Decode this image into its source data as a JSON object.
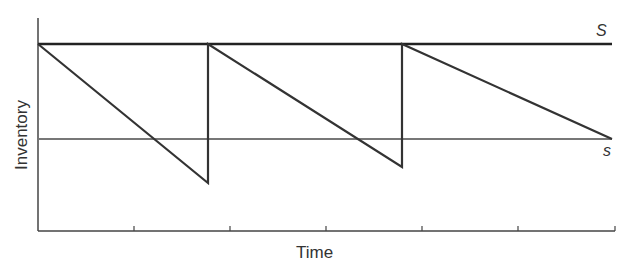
{
  "chart_data": {
    "type": "line",
    "title": "",
    "xlabel": "Time",
    "ylabel": "Inventory",
    "grid": false,
    "upper_level": {
      "label": "S",
      "y": 44
    },
    "reorder_level": {
      "label": "s",
      "y": 139
    },
    "series": [
      {
        "name": "Inventory level",
        "points": [
          [
            38,
            44
          ],
          [
            208,
            183
          ],
          [
            208,
            44
          ],
          [
            402,
            167
          ],
          [
            402,
            44
          ],
          [
            612,
            139
          ]
        ]
      }
    ],
    "x_ticks": [
      134,
      230,
      326,
      422,
      518,
      615
    ],
    "axis": {
      "x0": 38,
      "y_bottom": 231,
      "y_top": 18,
      "x_end": 615
    }
  },
  "labels": {
    "xlabel": "Time",
    "ylabel": "Inventory",
    "S": "S",
    "s": "s"
  }
}
